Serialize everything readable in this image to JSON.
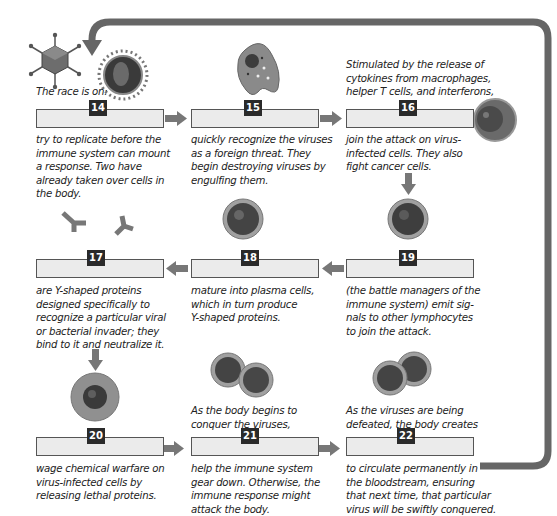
{
  "colors": {
    "arrow": "#666666",
    "blank_fill": "#ebebeb",
    "blank_border": "#555555",
    "badge_bg": "#2a2a2a",
    "badge_text": "#ffffff",
    "text": "#222222"
  },
  "steps": [
    {
      "number": "14",
      "image": "virus-particles",
      "before_text": "The race is on:",
      "after_text": "try to replicate before the\nimmune system can mount\na response. Two have\nalready taken over cells in\nthe body.",
      "answer": ""
    },
    {
      "number": "15",
      "image": "macrophage-cell",
      "before_text": "",
      "after_text": "quickly recognize the viruses\nas a foreign threat. They\nbegin destroying viruses by\nengulfing them.",
      "answer": ""
    },
    {
      "number": "16",
      "image": "natural-killer-cell",
      "before_text": "Stimulated by the release of\ncytokines from macrophages,\nhelper T cells, and interferons,",
      "after_text": "join the attack on virus-\ninfected cells. They also\nfight cancer cells.",
      "answer": ""
    },
    {
      "number": "17",
      "image": "antibodies-y-shaped",
      "before_text": "",
      "after_text": "are Y-shaped proteins\ndesigned specifically to\nrecognize a particular viral\nor bacterial invader; they\nbind to it and neutralize it.",
      "answer": ""
    },
    {
      "number": "18",
      "image": "b-cell",
      "before_text": "",
      "after_text": "mature into plasma cells,\nwhich in turn produce\nY-shaped proteins.",
      "answer": ""
    },
    {
      "number": "19",
      "image": "helper-t-cell",
      "before_text": "",
      "after_text": "(the battle managers of the\nimmune system) emit sig-\nnals to other lymphocytes\nto join the attack.",
      "answer": ""
    },
    {
      "number": "20",
      "image": "killer-t-cell",
      "before_text": "",
      "after_text": "wage chemical warfare on\nvirus-infected cells by\nreleasing lethal proteins.",
      "answer": ""
    },
    {
      "number": "21",
      "image": "suppressor-t-cells",
      "before_text": "As the body begins to\nconquer the viruses,",
      "after_text": "help the immune system\ngear down. Otherwise, the\nimmune response might\nattack the body.",
      "answer": ""
    },
    {
      "number": "22",
      "image": "memory-cells",
      "before_text": "As the viruses are being\ndefeated, the body creates",
      "after_text": "to circulate permanently in\nthe bloodstream, ensuring\nthat next time, that particular\nvirus will be swiftly conquered.",
      "answer": ""
    }
  ]
}
